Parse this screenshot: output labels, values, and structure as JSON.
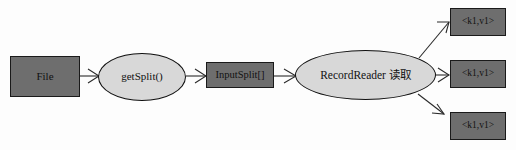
{
  "diagram": {
    "background_color": "#fdfdfd",
    "box_fill_color": "#6e6e6e",
    "ellipse_fill_color": "#d8d8d8",
    "stroke_color": "#2a2a2a",
    "nodes": [
      {
        "id": "file",
        "label": "File",
        "shape": "rectangle"
      },
      {
        "id": "getsplit",
        "label": "getSplit()",
        "shape": "ellipse"
      },
      {
        "id": "inputsplit",
        "label": "InputSplit[]",
        "shape": "rectangle"
      },
      {
        "id": "recordreader",
        "label": "RecordReader 读取",
        "shape": "ellipse"
      },
      {
        "id": "out1",
        "label": "<k1,v1>",
        "shape": "rectangle"
      },
      {
        "id": "out2",
        "label": "<k1,v1>",
        "shape": "rectangle"
      },
      {
        "id": "out3",
        "label": "<k1,v1>",
        "shape": "rectangle"
      }
    ],
    "edges": [
      {
        "from": "file",
        "to": "getsplit",
        "style": "arrow"
      },
      {
        "from": "getsplit",
        "to": "inputsplit",
        "style": "arrow"
      },
      {
        "from": "inputsplit",
        "to": "recordreader",
        "style": "arrow"
      },
      {
        "from": "recordreader",
        "to": "out1",
        "style": "arrow"
      },
      {
        "from": "recordreader",
        "to": "out2",
        "style": "arrow"
      },
      {
        "from": "recordreader",
        "to": "out3",
        "style": "arrow"
      }
    ]
  }
}
